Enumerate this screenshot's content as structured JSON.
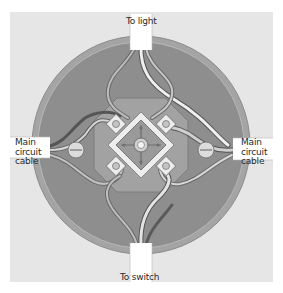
{
  "diagram": {
    "labels": {
      "top": "To light",
      "bottom": "To switch",
      "left": [
        "Main",
        "circuit",
        "cable"
      ],
      "right": [
        "Main",
        "circuit",
        "cable"
      ]
    },
    "colors": {
      "background": "#e6e6e6",
      "box_outer": "#9a9a9a",
      "box_inner": "#8a8a8a",
      "terminal_block": "#b0b0b0",
      "terminal_plate": "#ededed",
      "cable_white": "#f2f2f2",
      "wire_dark": "#5a5a5a"
    }
  }
}
